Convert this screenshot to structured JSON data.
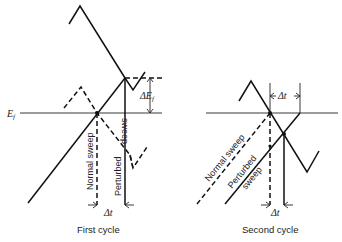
{
  "figure": {
    "panels": [
      {
        "id": "first-cycle",
        "caption": "First cycle",
        "labels": {
          "ef": "E",
          "ef_sub": "f",
          "delta_ef": "ΔE",
          "delta_ef_sub": "f",
          "normal_sweep": "Normal sweep",
          "perturbed_sweep": "Perturbed sweep",
          "perturbed_word": "Perturbed",
          "sweep_word": "sweep",
          "delta_t": "Δt"
        }
      },
      {
        "id": "second-cycle",
        "caption": "Second cycle",
        "labels": {
          "normal_sweep": "Normal sweep",
          "perturbed_word": "Perturbed",
          "sweep_word": "sweep",
          "delta_t_top": "Δt",
          "delta_t_bottom": "Δt"
        }
      }
    ]
  }
}
